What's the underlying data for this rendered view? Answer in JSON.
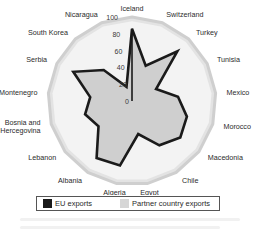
{
  "chart_data": {
    "type": "radar",
    "title": "",
    "categories": [
      "Iceland",
      "Switzerland",
      "Turkey",
      "Tunisia",
      "Mexico",
      "Morocco",
      "Macedonia",
      "Chile",
      "Egypt",
      "Algeria",
      "Albania",
      "Lebanon",
      "Bosnia and Hercegovina",
      "Montenegro",
      "Serbia",
      "South Korea",
      "Nicaragua"
    ],
    "series": [
      {
        "name": "EU exports",
        "values": [
          86,
          45,
          80,
          32,
          55,
          68,
          72,
          62,
          40,
          78,
          80,
          50,
          58,
          50,
          78,
          50,
          18
        ],
        "color": "#1a1a1a",
        "style": "outline"
      },
      {
        "name": "Partner country exports",
        "values": [
          100,
          100,
          100,
          100,
          100,
          100,
          100,
          100,
          100,
          100,
          100,
          100,
          100,
          100,
          100,
          100,
          100
        ],
        "color": "#d9d9d9",
        "style": "filled"
      }
    ],
    "radial_ticks": [
      "0",
      "20",
      "40",
      "60",
      "80",
      "100"
    ],
    "rlim": [
      0,
      100
    ],
    "legend_position": "bottom",
    "grid": true
  },
  "legend": {
    "eu_label": "EU exports",
    "partner_label": "Partner country exports",
    "eu_color": "#1a1a1a",
    "partner_color": "#d6d6d6"
  }
}
